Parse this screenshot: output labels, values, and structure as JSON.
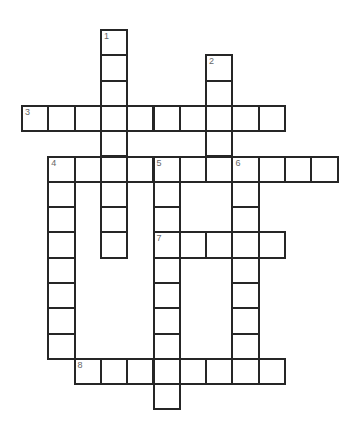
{
  "puzzle": {
    "grid": {
      "origin_x": 22,
      "origin_y": 30,
      "cell_w": 26.3,
      "cell_h": 25.3,
      "line_color": "#262626",
      "number_color": "#666666",
      "background": "#ffffff"
    },
    "entries": [
      {
        "number": "1",
        "direction": "down",
        "col": 3,
        "row": 0,
        "length": 9
      },
      {
        "number": "2",
        "direction": "down",
        "col": 7,
        "row": 1,
        "length": 5
      },
      {
        "number": "3",
        "direction": "across",
        "col": 0,
        "row": 3,
        "length": 10
      },
      {
        "number": "4",
        "direction": "across",
        "col": 1,
        "row": 5,
        "length": 11
      },
      {
        "number": "4",
        "direction": "down",
        "col": 1,
        "row": 5,
        "length": 8
      },
      {
        "number": "5",
        "direction": "down",
        "col": 5,
        "row": 5,
        "length": 10
      },
      {
        "number": "6",
        "direction": "down",
        "col": 8,
        "row": 5,
        "length": 9
      },
      {
        "number": "7",
        "direction": "across",
        "col": 5,
        "row": 8,
        "length": 5
      },
      {
        "number": "8",
        "direction": "across",
        "col": 2,
        "row": 13,
        "length": 8
      }
    ]
  }
}
